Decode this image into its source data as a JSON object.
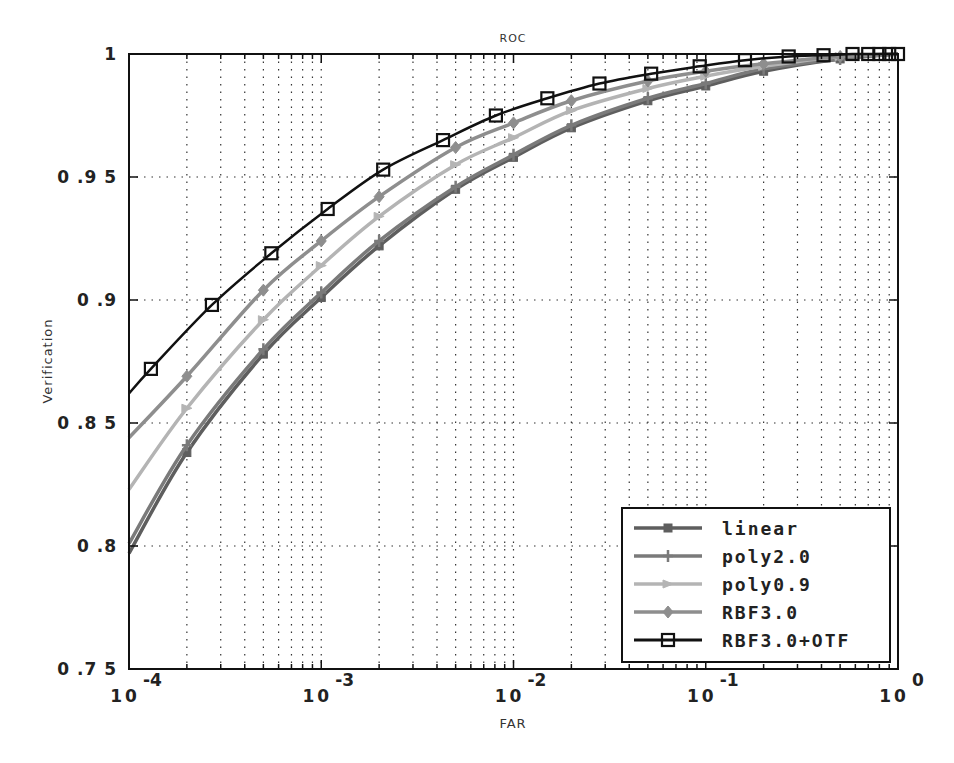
{
  "chart_data": {
    "type": "line",
    "title": "ROC",
    "xlabel": "FAR",
    "ylabel": "Verification",
    "xscale": "log",
    "xlim": [
      0.0001,
      1
    ],
    "ylim": [
      0.75,
      1
    ],
    "x_ticks": [
      {
        "base": "10",
        "exp": "-4",
        "value": 0.0001
      },
      {
        "base": "10",
        "exp": "-3",
        "value": 0.001
      },
      {
        "base": "10",
        "exp": "-2",
        "value": 0.01
      },
      {
        "base": "10",
        "exp": "-1",
        "value": 0.1
      },
      {
        "base": "10",
        "exp": "0",
        "value": 1
      }
    ],
    "y_ticks": [
      {
        "label": "0.75",
        "value": 0.75
      },
      {
        "label": "0.8",
        "value": 0.8
      },
      {
        "label": "0.85",
        "value": 0.85
      },
      {
        "label": "0.9",
        "value": 0.9
      },
      {
        "label": "0.95",
        "value": 0.95
      },
      {
        "label": "1",
        "value": 1.0
      }
    ],
    "grid": true,
    "legend_position": "lower right",
    "series": [
      {
        "name": "linear",
        "color": "#5e5e5e",
        "marker": "square-filled",
        "x": [
          0.0001,
          0.0002,
          0.0005,
          0.001,
          0.002,
          0.005,
          0.01,
          0.02,
          0.05,
          0.1,
          0.2,
          0.5,
          1.0
        ],
        "y": [
          0.797,
          0.838,
          0.878,
          0.901,
          0.922,
          0.945,
          0.958,
          0.97,
          0.981,
          0.987,
          0.993,
          0.998,
          1.0
        ]
      },
      {
        "name": "poly2.0",
        "color": "#7a7a7a",
        "marker": "plus",
        "x": [
          0.0001,
          0.0002,
          0.0005,
          0.001,
          0.002,
          0.005,
          0.01,
          0.02,
          0.05,
          0.1,
          0.2,
          0.5,
          1.0
        ],
        "y": [
          0.801,
          0.841,
          0.88,
          0.903,
          0.924,
          0.946,
          0.959,
          0.971,
          0.982,
          0.988,
          0.994,
          0.998,
          1.0
        ]
      },
      {
        "name": "poly0.9",
        "color": "#b4b4b4",
        "marker": "triangle",
        "x": [
          0.0001,
          0.0002,
          0.0005,
          0.001,
          0.002,
          0.005,
          0.01,
          0.02,
          0.05,
          0.1,
          0.2,
          0.5,
          1.0
        ],
        "y": [
          0.823,
          0.856,
          0.892,
          0.914,
          0.934,
          0.955,
          0.966,
          0.977,
          0.986,
          0.991,
          0.995,
          0.999,
          1.0
        ]
      },
      {
        "name": "RBF3.0",
        "color": "#8e8e8e",
        "marker": "diamond",
        "x": [
          0.0001,
          0.0002,
          0.0005,
          0.001,
          0.002,
          0.005,
          0.01,
          0.02,
          0.05,
          0.1,
          0.2,
          0.5,
          1.0
        ],
        "y": [
          0.844,
          0.869,
          0.904,
          0.924,
          0.942,
          0.962,
          0.972,
          0.981,
          0.989,
          0.993,
          0.996,
          0.999,
          1.0
        ]
      },
      {
        "name": "RBF3.0+OTF",
        "color": "#111111",
        "marker": "square-open",
        "x": [
          0.0001,
          0.00013,
          0.00027,
          0.00055,
          0.00108,
          0.0021,
          0.0043,
          0.0081,
          0.015,
          0.028,
          0.052,
          0.093,
          0.16,
          0.27,
          0.41,
          0.58,
          0.7,
          0.8,
          0.9,
          1.0
        ],
        "y": [
          0.862,
          0.872,
          0.898,
          0.919,
          0.937,
          0.953,
          0.965,
          0.975,
          0.982,
          0.988,
          0.992,
          0.995,
          0.9975,
          0.999,
          0.9995,
          1.0,
          1.0,
          1.0,
          1.0,
          1.0
        ]
      }
    ]
  }
}
